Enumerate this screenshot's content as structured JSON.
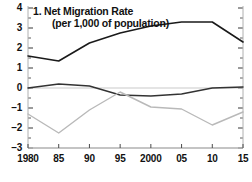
{
  "chart_data": {
    "type": "line",
    "title": "1. Net Migration Rate",
    "subtitle": "(per 1,000 of population)",
    "xlabel": "",
    "ylabel": "",
    "ylim": [
      -3,
      4
    ],
    "xlim": [
      1980,
      2015
    ],
    "ytick_labels": [
      "4",
      "3",
      "2",
      "1",
      "0",
      "-1",
      "-2",
      "-3"
    ],
    "ytick_values": [
      4,
      3,
      2,
      1,
      0,
      -1,
      -2,
      -3
    ],
    "yminor_step": 0.5,
    "xtick_labels": [
      "1980",
      "85",
      "90",
      "95",
      "2000",
      "05",
      "10",
      "15"
    ],
    "xtick_values": [
      1980,
      1985,
      1990,
      1995,
      2000,
      2005,
      2010,
      2015
    ],
    "grid": false,
    "zero_line": true,
    "legend": "none",
    "ticks_both_sides": true,
    "x": [
      1980,
      1985,
      1990,
      1995,
      2000,
      2005,
      2010,
      2015
    ],
    "series": [
      {
        "name": "upper-line",
        "color": "#1a1a1a",
        "width": 1.6,
        "values": [
          1.6,
          1.35,
          2.25,
          2.75,
          3.1,
          3.3,
          3.3,
          2.3
        ]
      },
      {
        "name": "mid-line",
        "color": "#333333",
        "width": 1.4,
        "values": [
          0.0,
          0.2,
          0.1,
          -0.35,
          -0.4,
          -0.3,
          0.0,
          0.05
        ]
      },
      {
        "name": "lower-line",
        "color": "#b9b9b9",
        "width": 1.4,
        "values": [
          -1.3,
          -2.25,
          -1.1,
          -0.2,
          -0.95,
          -1.05,
          -1.85,
          -1.2
        ]
      }
    ]
  },
  "axis": {
    "zero_line_color": "#c9c9c9",
    "baseline_color": "#b0b0b0",
    "tick_color": "#4a4a4a"
  }
}
